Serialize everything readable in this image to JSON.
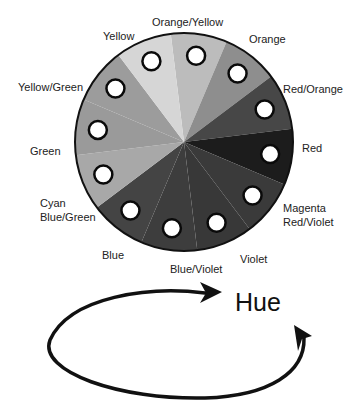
{
  "diagram": {
    "title": "Hue",
    "wheel": {
      "center": [
        184,
        142
      ],
      "radius": 109,
      "outline_color": "#111111",
      "segments": [
        {
          "name": "Orange/Yellow",
          "color": "#bcbcbc"
        },
        {
          "name": "Orange",
          "color": "#8e8e8e"
        },
        {
          "name": "Red/Orange",
          "color": "#474747"
        },
        {
          "name": "Red",
          "color": "#1c1c1c"
        },
        {
          "name": "Magenta Red/Violet",
          "color": "#3a3a3a"
        },
        {
          "name": "Violet",
          "color": "#383838"
        },
        {
          "name": "Blue/Violet",
          "color": "#3d3d3d"
        },
        {
          "name": "Blue",
          "color": "#444444"
        },
        {
          "name": "Cyan Blue/Green",
          "color": "#a8a8a8"
        },
        {
          "name": "Green",
          "color": "#9a9a9a"
        },
        {
          "name": "Yellow/Green",
          "color": "#9c9c9c"
        },
        {
          "name": "Yellow",
          "color": "#d6d6d6"
        }
      ]
    },
    "labels": {
      "orange_yellow": "Orange/Yellow",
      "orange": "Orange",
      "red_orange": "Red/Orange",
      "red": "Red",
      "magenta": "Magenta",
      "red_violet": "Red/Violet",
      "violet": "Violet",
      "blue_violet": "Blue/Violet",
      "blue": "Blue",
      "cyan": "Cyan",
      "blue_green": "Blue/Green",
      "green": "Green",
      "yellow_green": "Yellow/Green",
      "yellow": "Yellow"
    },
    "cycle_arrow": "circular arrow indicating hue rotation"
  }
}
